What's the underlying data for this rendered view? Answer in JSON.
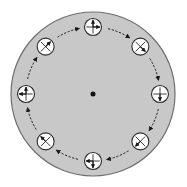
{
  "diagram": {
    "colors": {
      "background": "#ffffff",
      "disk_fill": "#c8c8c8",
      "disk_stroke": "#6e6e6e",
      "marker_fill": "#ffffff",
      "marker_stroke": "#2a2a2a",
      "arrow": "#1a1a1a",
      "center_dot": "#111111"
    },
    "disk": {
      "cx": 93,
      "cy": 94,
      "r": 82
    },
    "center": {
      "label": "rotation-axis",
      "r": 2.5
    },
    "rotation_direction": "clockwise",
    "orbit_radius": 67,
    "markers": [
      {
        "id": "top",
        "angle": -90,
        "cross": "plus",
        "arrows": [
          "up",
          "right"
        ]
      },
      {
        "id": "top-right",
        "angle": -45,
        "cross": "x",
        "arrows": [
          "down-right"
        ]
      },
      {
        "id": "right",
        "angle": 0,
        "cross": "plus",
        "arrows": [
          "down"
        ]
      },
      {
        "id": "bottom-right",
        "angle": 45,
        "cross": "x",
        "arrows": [
          "down-left"
        ]
      },
      {
        "id": "bottom",
        "angle": 90,
        "cross": "plus",
        "arrows": [
          "down",
          "left"
        ]
      },
      {
        "id": "bottom-left",
        "angle": 135,
        "cross": "x",
        "arrows": [
          "up-left"
        ]
      },
      {
        "id": "left",
        "angle": 180,
        "cross": "plus",
        "arrows": [
          "up",
          "left"
        ]
      },
      {
        "id": "top-left",
        "angle": -135,
        "cross": "x",
        "arrows": [
          "up-right"
        ]
      }
    ],
    "marker_radius": 8.5
  }
}
